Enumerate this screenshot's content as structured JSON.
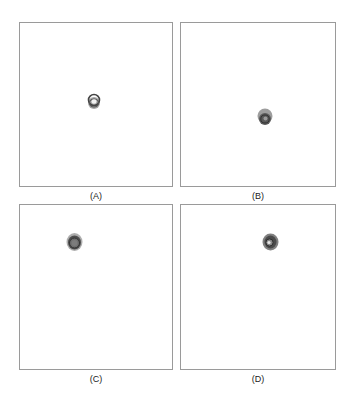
{
  "figure": {
    "panels": [
      {
        "id": "A",
        "label": "(A)",
        "box": {
          "x": 19,
          "y": 22,
          "w": 154,
          "h": 165
        },
        "blob": {
          "cx": 94,
          "cy": 102,
          "rx": 6,
          "ry": 8,
          "style": "ring"
        }
      },
      {
        "id": "B",
        "label": "(B)",
        "box": {
          "x": 180,
          "y": 22,
          "w": 156,
          "h": 165
        },
        "blob": {
          "cx": 265,
          "cy": 117,
          "rx": 7,
          "ry": 8,
          "style": "filled"
        }
      },
      {
        "id": "C",
        "label": "(C)",
        "box": {
          "x": 19,
          "y": 204,
          "w": 154,
          "h": 166
        },
        "blob": {
          "cx": 74,
          "cy": 243,
          "rx": 7,
          "ry": 8,
          "style": "filled"
        }
      },
      {
        "id": "D",
        "label": "(D)",
        "box": {
          "x": 180,
          "y": 204,
          "w": 156,
          "h": 166
        },
        "blob": {
          "cx": 270,
          "cy": 242,
          "rx": 7,
          "ry": 8,
          "style": "filled"
        }
      }
    ],
    "colors": {
      "border": "#9a9a9a",
      "blob_dark": "#4a4a4a",
      "blob_mid": "#7a7a7a",
      "blob_light": "#b0b0b0",
      "label": "#222222"
    }
  }
}
